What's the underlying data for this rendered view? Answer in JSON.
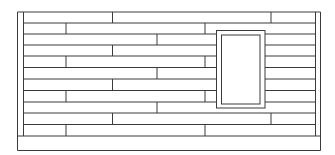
{
  "diagram": {
    "type": "wall-elevation",
    "stroke_color": "#3a3a3a",
    "background_color": "#ffffff",
    "frame": {
      "outer": {
        "x1": 17.5,
        "x2": 320.5,
        "y_top": 12,
        "y_bottom": 150.5
      },
      "inner_left_x": 23.5,
      "inner_right_x": 315.5
    },
    "courses": {
      "y_lines": [
        12,
        23,
        34,
        45,
        56,
        67.5,
        79,
        90.5,
        102,
        113,
        124.5,
        136
      ],
      "count": 11
    },
    "joints": [
      {
        "row": 0,
        "x": [
          112.5,
          271
        ]
      },
      {
        "row": 1,
        "x": [
          66,
          205
        ]
      },
      {
        "row": 2,
        "x": [
          157
        ]
      },
      {
        "row": 3,
        "x": [
          112.5
        ]
      },
      {
        "row": 4,
        "x": [
          66,
          205
        ]
      },
      {
        "row": 5,
        "x": [
          157
        ]
      },
      {
        "row": 6,
        "x": [
          112.5
        ]
      },
      {
        "row": 7,
        "x": [
          66,
          205
        ]
      },
      {
        "row": 8,
        "x": [
          157
        ]
      },
      {
        "row": 9,
        "x": [
          112.5,
          271
        ]
      },
      {
        "row": 10,
        "x": [
          66,
          205
        ]
      }
    ],
    "window": {
      "outer": {
        "x": 216.5,
        "y": 30.5,
        "w": 48.5,
        "h": 77.5
      },
      "inner": {
        "x": 221.5,
        "y": 35,
        "w": 38.5,
        "h": 69
      }
    },
    "plinth": {
      "y_top": 136,
      "y_bottom": 150.5
    }
  }
}
